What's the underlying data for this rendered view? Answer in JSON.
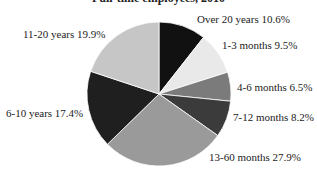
{
  "chart_data": {
    "type": "pie",
    "title": "Full-time employees, 2010",
    "start_angle": "12 o'clock",
    "direction": "clockwise",
    "legend": "none (direct labels)",
    "slices": [
      {
        "label": "Over 20 years",
        "value": 10.6,
        "display": "Over 20 years 10.6%",
        "color": "#111111"
      },
      {
        "label": "1-3 months",
        "value": 9.5,
        "display": "1-3 months 9.5%",
        "color": "#e9e9e9"
      },
      {
        "label": "4-6 months",
        "value": 6.5,
        "display": "4-6 months 6.5%",
        "color": "#7b7b7b"
      },
      {
        "label": "7-12 months",
        "value": 8.2,
        "display": "7-12 months 8.2%",
        "color": "#3b3b3b"
      },
      {
        "label": "13-60 months",
        "value": 27.9,
        "display": "13-60 months 27.9%",
        "color": "#9a9a9a"
      },
      {
        "label": "6-10 years",
        "value": 17.4,
        "display": "6-10 years 17.4%",
        "color": "#1f1f1f"
      },
      {
        "label": "11-20 years",
        "value": 19.9,
        "display": "11-20 years 19.9%",
        "color": "#c6c6c6"
      }
    ]
  }
}
